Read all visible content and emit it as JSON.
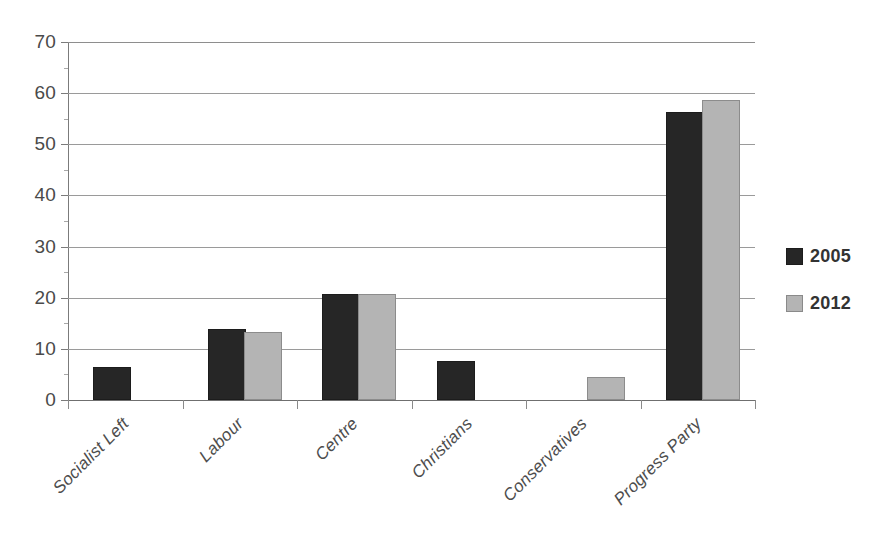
{
  "chart_data": {
    "type": "bar",
    "title": "",
    "subtitle": "",
    "xlabel": "",
    "ylabel": "",
    "ylim": [
      0,
      70
    ],
    "ytick_step": 10,
    "ytick_labels": [
      "70",
      "60",
      "50",
      "40",
      "30",
      "20",
      "10",
      "0"
    ],
    "ytick_values": [
      70,
      60,
      50,
      40,
      30,
      20,
      10,
      0
    ],
    "grid": true,
    "grid_axis": "y",
    "legend_position": "right",
    "categories": [
      "Socialist Left",
      "Labour",
      "Centre",
      "Christians",
      "Conservatives",
      "Progress Party"
    ],
    "series": [
      {
        "name": "2005",
        "color": "#262626",
        "values": [
          6,
          13.5,
          20.3,
          7.3,
          null,
          56
        ]
      },
      {
        "name": "2012",
        "color": "#b4b4b4",
        "values": [
          null,
          13,
          20.3,
          null,
          4.2,
          58.3
        ]
      }
    ]
  },
  "legend": {
    "entries": [
      {
        "label": "2005",
        "swatch": "dark-square-swatch"
      },
      {
        "label": "2012",
        "swatch": "light-gray-square-swatch"
      }
    ]
  },
  "colors": {
    "series_2005": "#262626",
    "series_2012": "#b4b4b4",
    "gridline": "#9a9a9a",
    "axis": "#6f6f6f",
    "text": "#4a4a4a",
    "background": "#ffffff"
  }
}
